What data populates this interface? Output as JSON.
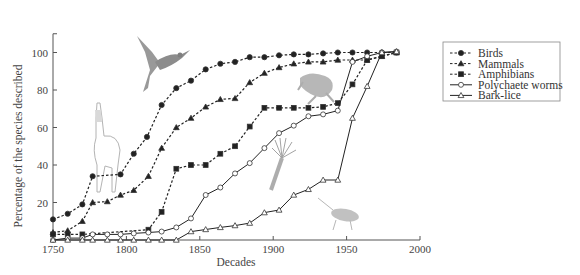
{
  "chart_data": {
    "type": "line",
    "title": "",
    "xlabel": "Decades",
    "ylabel": "Percentage of the species described",
    "xlim": [
      1750,
      2000
    ],
    "ylim": [
      0,
      110
    ],
    "xticks": [
      1750,
      1800,
      1850,
      1900,
      1950,
      2000
    ],
    "yticks": [
      20,
      40,
      60,
      80,
      100
    ],
    "grid": false,
    "legend_position": "top-right",
    "series": [
      {
        "name": "Birds",
        "style": "dashed",
        "marker": "filled-circle",
        "points": [
          [
            1750,
            11
          ],
          [
            1760,
            14
          ],
          [
            1770,
            19
          ],
          [
            1777,
            34
          ],
          [
            1796,
            35
          ],
          [
            1805,
            46
          ],
          [
            1814,
            55
          ],
          [
            1824,
            72
          ],
          [
            1834,
            81
          ],
          [
            1844,
            85
          ],
          [
            1854,
            91
          ],
          [
            1864,
            94
          ],
          [
            1874,
            95
          ],
          [
            1884,
            97.5
          ],
          [
            1894,
            97.5
          ],
          [
            1904,
            98.5
          ],
          [
            1914,
            99
          ],
          [
            1924,
            99
          ],
          [
            1934,
            99.5
          ],
          [
            1944,
            100
          ],
          [
            1954,
            100
          ],
          [
            1964,
            100
          ],
          [
            1974,
            100
          ],
          [
            1984,
            100
          ]
        ]
      },
      {
        "name": "Mammals",
        "style": "dashed",
        "marker": "filled-triangle",
        "points": [
          [
            1750,
            4
          ],
          [
            1760,
            5
          ],
          [
            1770,
            10
          ],
          [
            1777,
            20
          ],
          [
            1787,
            20.5
          ],
          [
            1796,
            24
          ],
          [
            1805,
            26.5
          ],
          [
            1815,
            34
          ],
          [
            1824,
            49
          ],
          [
            1834,
            60
          ],
          [
            1844,
            65
          ],
          [
            1854,
            71
          ],
          [
            1864,
            75
          ],
          [
            1874,
            75.5
          ],
          [
            1884,
            84
          ],
          [
            1894,
            89
          ],
          [
            1904,
            92
          ],
          [
            1914,
            94
          ],
          [
            1924,
            95
          ],
          [
            1934,
            95
          ],
          [
            1944,
            96
          ],
          [
            1954,
            96
          ],
          [
            1964,
            96
          ],
          [
            1974,
            98
          ],
          [
            1984,
            100
          ]
        ]
      },
      {
        "name": "Amphibians",
        "style": "dashed",
        "marker": "filled-square",
        "points": [
          [
            1750,
            3
          ],
          [
            1760,
            3
          ],
          [
            1770,
            3
          ],
          [
            1815,
            5.5
          ],
          [
            1824,
            15
          ],
          [
            1834,
            38
          ],
          [
            1844,
            40
          ],
          [
            1854,
            40
          ],
          [
            1864,
            46
          ],
          [
            1874,
            50
          ],
          [
            1884,
            60.5
          ],
          [
            1894,
            70.5
          ],
          [
            1904,
            70.5
          ],
          [
            1914,
            70.5
          ],
          [
            1924,
            70.5
          ],
          [
            1934,
            71
          ],
          [
            1944,
            73
          ],
          [
            1954,
            83
          ],
          [
            1964,
            96
          ],
          [
            1974,
            98
          ],
          [
            1984,
            100
          ]
        ]
      },
      {
        "name": "Polychaete worms",
        "style": "solid",
        "marker": "open-circle",
        "points": [
          [
            1750,
            0
          ],
          [
            1760,
            1
          ],
          [
            1770,
            1
          ],
          [
            1777,
            3
          ],
          [
            1787,
            3
          ],
          [
            1796,
            3
          ],
          [
            1805,
            3.5
          ],
          [
            1815,
            4
          ],
          [
            1824,
            4.5
          ],
          [
            1834,
            6.7
          ],
          [
            1844,
            11.5
          ],
          [
            1854,
            24
          ],
          [
            1864,
            28
          ],
          [
            1874,
            35.5
          ],
          [
            1884,
            41
          ],
          [
            1894,
            49
          ],
          [
            1904,
            57
          ],
          [
            1914,
            61
          ],
          [
            1924,
            66
          ],
          [
            1934,
            67
          ],
          [
            1944,
            69
          ],
          [
            1954,
            95
          ],
          [
            1964,
            98
          ],
          [
            1974,
            100
          ],
          [
            1984,
            100.5
          ]
        ]
      },
      {
        "name": "Bark-lice",
        "style": "solid",
        "marker": "open-triangle",
        "points": [
          [
            1750,
            0
          ],
          [
            1760,
            0
          ],
          [
            1770,
            0
          ],
          [
            1777,
            0
          ],
          [
            1787,
            0
          ],
          [
            1796,
            0
          ],
          [
            1805,
            0
          ],
          [
            1815,
            0
          ],
          [
            1824,
            0
          ],
          [
            1834,
            0
          ],
          [
            1844,
            4.5
          ],
          [
            1854,
            5.6
          ],
          [
            1864,
            6.7
          ],
          [
            1874,
            7.7
          ],
          [
            1884,
            9
          ],
          [
            1894,
            14.6
          ],
          [
            1904,
            16
          ],
          [
            1914,
            24
          ],
          [
            1924,
            27
          ],
          [
            1934,
            32
          ],
          [
            1944,
            32
          ],
          [
            1954,
            65
          ],
          [
            1964,
            82
          ],
          [
            1974,
            100
          ],
          [
            1984,
            100.5
          ]
        ]
      }
    ]
  },
  "illustrations": [
    "hummingbird",
    "llama",
    "frog",
    "polychaete-worm",
    "bark-louse"
  ]
}
